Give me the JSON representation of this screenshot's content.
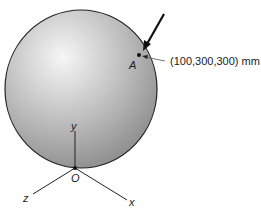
{
  "diagram": {
    "sphere": {
      "fill_light": "#f4f4f4",
      "fill_dark": "#8a8a8a",
      "outline": "#222222"
    },
    "point_a": {
      "label": "A",
      "coordinates": "(100,300,300) mm"
    },
    "origin": {
      "label": "O"
    },
    "axes": {
      "x": "x",
      "y": "y",
      "z": "z"
    }
  }
}
